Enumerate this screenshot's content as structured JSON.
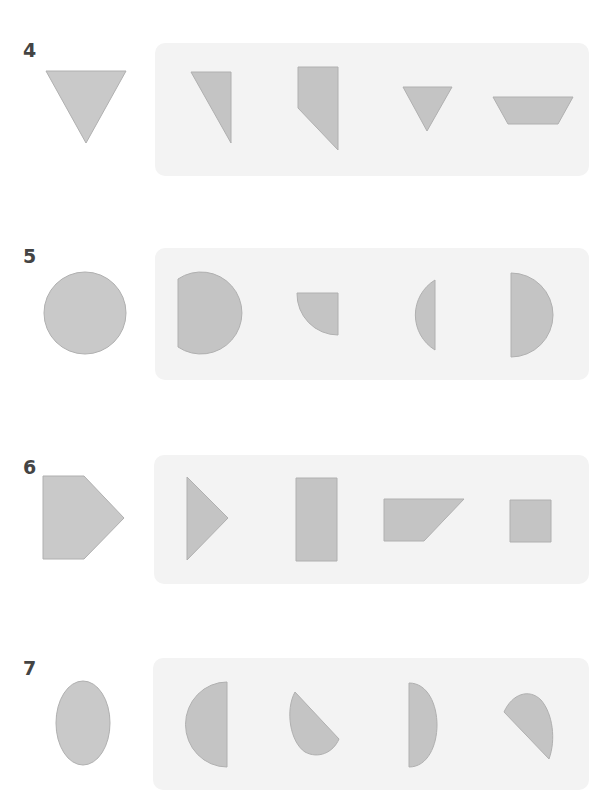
{
  "colors": {
    "panel_bg": "#f3f3f3",
    "shape_fill": "#c9c9c9",
    "shape_stroke": "#b0b0b0",
    "option_fill": "#c4c4c4",
    "label": "#444444"
  },
  "problems": [
    {
      "number": "4",
      "target": "inverted-triangle",
      "options": [
        "right-triangle-half",
        "pentagon-cut-corner",
        "small-inverted-triangle",
        "trapezoid"
      ]
    },
    {
      "number": "5",
      "target": "circle",
      "options": [
        "circle-minus-sliver",
        "quarter-circle",
        "circle-segment",
        "semicircle"
      ]
    },
    {
      "number": "6",
      "target": "pentagon-arrow",
      "options": [
        "triangle",
        "tall-rectangle",
        "right-trapezoid",
        "square"
      ]
    },
    {
      "number": "7",
      "target": "ellipse",
      "options": [
        "half-ellipse-left",
        "diagonal-half-ellipse",
        "half-ellipse-right",
        "diagonal-half-ellipse-2"
      ]
    }
  ]
}
